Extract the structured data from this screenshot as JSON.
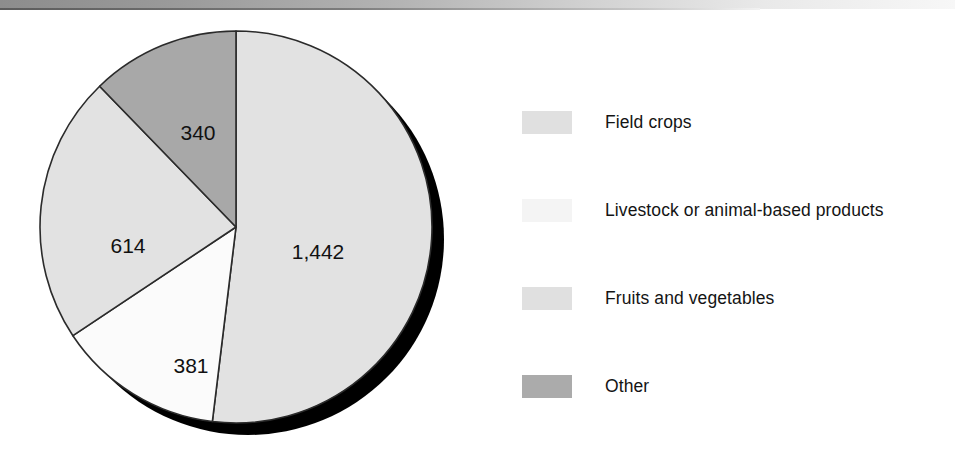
{
  "page": {
    "background_color": "#ffffff",
    "scan_edge_band": "scan-edge-band"
  },
  "chart_data": {
    "type": "pie",
    "title": "",
    "subtitle": "",
    "xlabel": "",
    "ylabel": "",
    "grid": false,
    "legend_position": "right",
    "start_angle_deg": 0,
    "direction": "clockwise",
    "total": 2777,
    "categories": [
      "Field crops",
      "Livestock or animal-based products",
      "Fruits and vegetables",
      "Other"
    ],
    "values": [
      1442,
      381,
      614,
      340
    ],
    "data_labels": [
      "1,442",
      "381",
      "614",
      "340"
    ],
    "slice_colors": [
      "#e2e2e2",
      "#fbfbfb",
      "#e2e2e2",
      "#a8a8a8"
    ],
    "slice_outline_color": "#2b2b2b",
    "shadow_color": "#000000",
    "slices": [
      {
        "name": "Field crops",
        "value": 1442,
        "label": "1,442",
        "color": "#e2e2e2",
        "start_deg": 0,
        "sweep_deg": 186.93,
        "label_x": 290,
        "label_y": 239
      },
      {
        "name": "Livestock or animal-based products",
        "value": 381,
        "label": "381",
        "color": "#fbfbfb",
        "start_deg": 186.93,
        "sweep_deg": 49.39,
        "label_x": 163,
        "label_y": 353
      },
      {
        "name": "Fruits and vegetables",
        "value": 614,
        "label": "614",
        "color": "#e2e2e2",
        "start_deg": 236.32,
        "sweep_deg": 79.59,
        "label_x": 100,
        "label_y": 233
      },
      {
        "name": "Other",
        "value": 340,
        "label": "340",
        "color": "#a8a8a8",
        "start_deg": 315.91,
        "sweep_deg": 44.09,
        "label_x": 170,
        "label_y": 120
      }
    ]
  },
  "legend": {
    "items": [
      {
        "label": "Field crops",
        "color": "#e0e0e0"
      },
      {
        "label": "Livestock or animal-based products",
        "color": "#f4f4f4"
      },
      {
        "label": "Fruits and vegetables",
        "color": "#e0e0e0"
      },
      {
        "label": "Other",
        "color": "#ababab"
      }
    ]
  }
}
